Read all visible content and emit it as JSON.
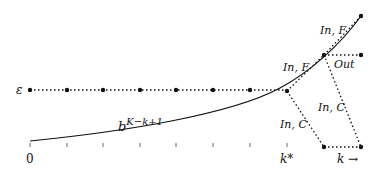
{
  "diagram": {
    "epsilon_label": "ε",
    "curve_label_base": "b",
    "curve_label_exp": "K−k+1",
    "x_axis": {
      "origin_label": "0",
      "kstar_label": "k*",
      "k_label": "k →",
      "tick_count": 8
    },
    "edges": {
      "in_f_lower": "In, F",
      "in_f_upper": "In, F",
      "out": "Out",
      "in_c_lower": "In, C",
      "in_c_upper": "In, C"
    },
    "colors": {
      "ink": "#111111",
      "background": "#ffffff"
    }
  }
}
